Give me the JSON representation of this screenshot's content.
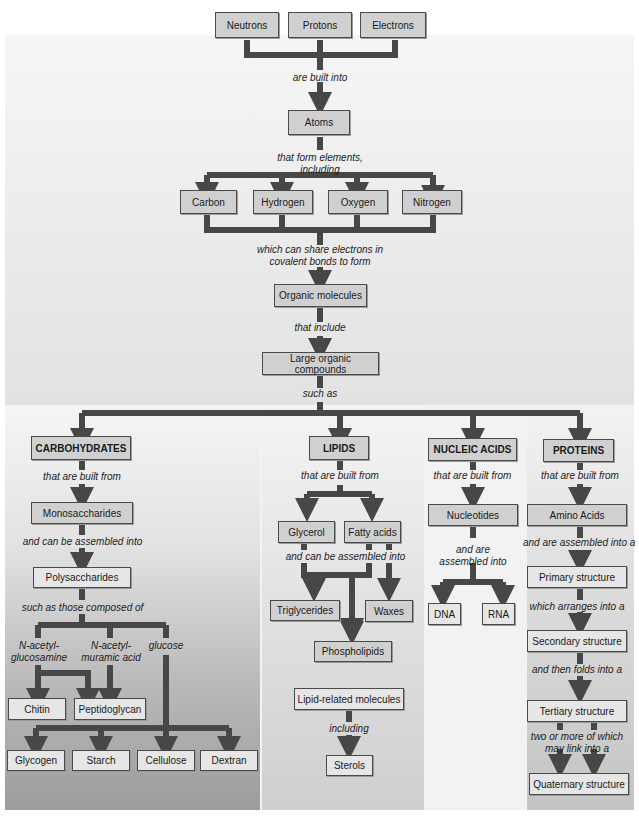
{
  "theme": {
    "connector_color": "#474747",
    "box_fill": "#d0d0d0",
    "box_border": "#4a4a4a"
  },
  "top": {
    "particles": [
      "Neutrons",
      "Protons",
      "Electrons"
    ],
    "link1": "are built into",
    "atoms": "Atoms",
    "link2": [
      "that form elements,",
      "including"
    ],
    "elements": [
      "Carbon",
      "Hydrogen",
      "Oxygen",
      "Nitrogen"
    ],
    "link3": [
      "which can share electrons in",
      "covalent bonds to form"
    ],
    "organic": "Organic molecules",
    "link4": "that include",
    "large": "Large organic compounds",
    "link5": "such as"
  },
  "carbohydrates": {
    "title": "CARBOHYDRATES",
    "link1": "that are built from",
    "mono": "Monosaccharides",
    "link2": "and can be assembled into",
    "poly": "Polysaccharides",
    "link3": "such as those composed of",
    "sources": [
      [
        "N-acetyl-",
        "glucosamine"
      ],
      [
        "N-acetyl-",
        "muramic acid"
      ],
      [
        "glucose"
      ]
    ],
    "products_a": [
      "Chitin",
      "Peptidoglycan"
    ],
    "products_b": [
      "Glycogen",
      "Starch",
      "Cellulose",
      "Dextran"
    ]
  },
  "lipids": {
    "title": "LIPIDS",
    "link1": "that are built from",
    "parts": [
      "Glycerol",
      "Fatty acids"
    ],
    "link2": "and can be assembled into",
    "products": [
      "Triglycerides",
      "Waxes",
      "Phospholipids"
    ],
    "related": "Lipid-related molecules",
    "link3": "including",
    "sterols": "Sterols"
  },
  "nucleic_acids": {
    "title": "NUCLEIC ACIDS",
    "link1": "that are built from",
    "unit": "Nucleotides",
    "link2": [
      "and are",
      "assembled into"
    ],
    "products": [
      "DNA",
      "RNA"
    ]
  },
  "proteins": {
    "title": "PROTEINS",
    "link1": "that are built from",
    "unit": "Amino Acids",
    "link2": "and are assembled into a",
    "primary": "Primary structure",
    "link3": "which arranges into a",
    "secondary": "Secondary structure",
    "link4": "and then folds into a",
    "tertiary": "Tertiary structure",
    "link5": [
      "two or more of which",
      "may link into a"
    ],
    "quaternary": "Quaternary structure"
  }
}
